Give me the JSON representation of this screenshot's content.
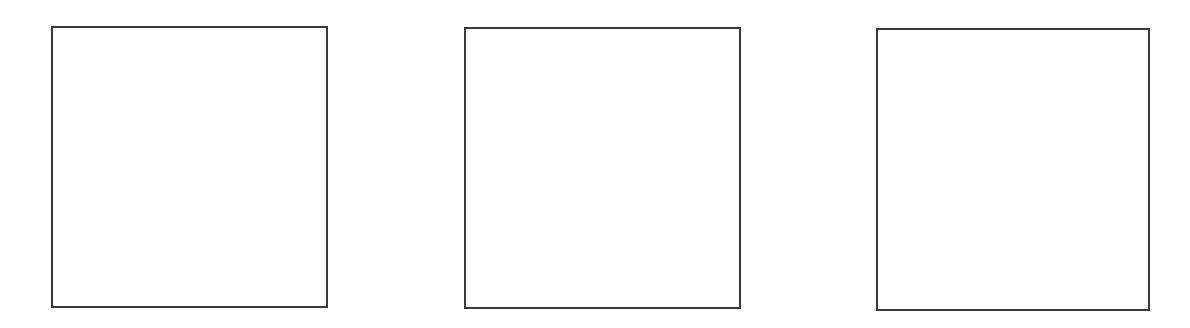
{
  "diagram": {
    "border_color": "#3a3a3a",
    "background_color": "#ffffff",
    "frames": [
      {
        "id": "frame-1",
        "label": ""
      },
      {
        "id": "frame-2",
        "label": ""
      },
      {
        "id": "frame-3",
        "label": ""
      }
    ]
  }
}
